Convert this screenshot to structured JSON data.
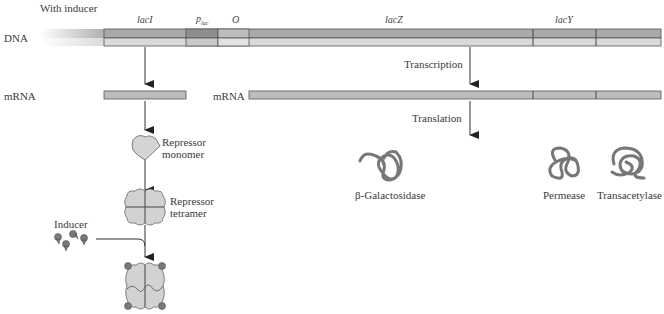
{
  "title": "With inducer",
  "dna": {
    "label": "DNA",
    "genes": [
      {
        "name": "lacI",
        "x1": 104,
        "x2": 186
      },
      {
        "name": "p",
        "sub": "lac",
        "x1": 186,
        "x2": 218
      },
      {
        "name": "O",
        "x1": 218,
        "x2": 249
      },
      {
        "name": "lacZ",
        "x1": 249,
        "x2": 533
      },
      {
        "name": "lacY",
        "x1": 533,
        "x2": 596
      },
      {
        "name": "",
        "x1": 596,
        "x2": 661
      }
    ]
  },
  "mrna_left": {
    "label": "mRNA"
  },
  "mrna_right": {
    "label": "mRNA"
  },
  "process": {
    "transcription": "Transcription",
    "translation": "Translation"
  },
  "repressor": {
    "monomer_line1": "Repressor",
    "monomer_line2": "monomer",
    "tetramer_line1": "Repressor",
    "tetramer_line2": "tetramer",
    "inducer": "Inducer"
  },
  "products": {
    "galactosidase": "β-Galactosidase",
    "permease": "Permease",
    "transacetylase": "Transacetylase"
  },
  "colors": {
    "strand_top": "#a9a9a9",
    "strand_bottom": "#d9d9d9",
    "promoter": "#8e8e8e",
    "mrna": "#bdbdbd",
    "protein": "#d2d2d2",
    "coil": "#8a8a8a",
    "inducer": "#7a7a7a"
  }
}
